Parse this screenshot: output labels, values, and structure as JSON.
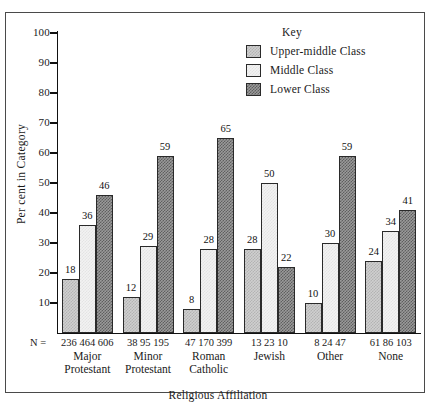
{
  "chart_data": {
    "type": "bar",
    "title": "",
    "xlabel": "Religious Affiliation",
    "ylabel": "Per cent in Category",
    "ylim": [
      0,
      100
    ],
    "ytick_labels": [
      "100",
      "90",
      "80",
      "70",
      "60",
      "50",
      "40",
      "30",
      "20",
      "10"
    ],
    "yticks": [
      100,
      90,
      80,
      70,
      60,
      50,
      40,
      30,
      20,
      10
    ],
    "grid": false,
    "legend_position": "top-right",
    "legend_title": "Key",
    "categories": [
      "Major Protestant",
      "Minor Protestant",
      "Roman Catholic",
      "Jewish",
      "Other",
      "None"
    ],
    "category_lines": [
      [
        "Major",
        "Protestant"
      ],
      [
        "Minor",
        "Protestant"
      ],
      [
        "Roman",
        "Catholic"
      ],
      [
        "Jewish"
      ],
      [
        "Other"
      ],
      [
        "None"
      ]
    ],
    "series": [
      {
        "name": "Upper-middle Class",
        "values": [
          18,
          12,
          8,
          28,
          10,
          24
        ]
      },
      {
        "name": "Middle Class",
        "values": [
          36,
          29,
          28,
          50,
          30,
          34
        ]
      },
      {
        "name": "Lower Class",
        "values": [
          46,
          59,
          65,
          22,
          59,
          41
        ]
      }
    ],
    "n_label": "N =",
    "n_values": [
      [
        236,
        464,
        606
      ],
      [
        38,
        95,
        195
      ],
      [
        47,
        170,
        399
      ],
      [
        13,
        23,
        10
      ],
      [
        8,
        24,
        47
      ],
      [
        61,
        86,
        103
      ]
    ],
    "colors": {
      "upper_middle": "#cfcfcf",
      "middle": "#f2f2f2",
      "lower": "#9a9a9a",
      "outline": "#2a2a2a",
      "axis": "#111111",
      "frame": "#4a4a4a"
    }
  }
}
